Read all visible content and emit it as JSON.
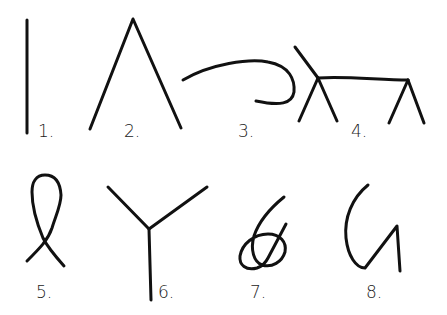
{
  "figure": {
    "stroke_color": "#111111",
    "background": "#ffffff",
    "items": [
      {
        "number": "1.",
        "shape": "vertical-line"
      },
      {
        "number": "2.",
        "shape": "inverted-v"
      },
      {
        "number": "3.",
        "shape": "curl"
      },
      {
        "number": "4.",
        "shape": "table-stick-figure"
      },
      {
        "number": "5.",
        "shape": "loop-ribbon"
      },
      {
        "number": "6.",
        "shape": "y-branch"
      },
      {
        "number": "7.",
        "shape": "knot"
      },
      {
        "number": "8.",
        "shape": "hook-zigzag"
      }
    ]
  }
}
